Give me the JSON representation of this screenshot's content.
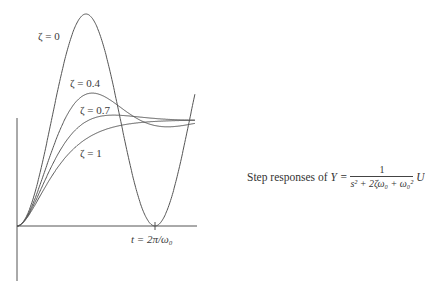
{
  "chart_data": {
    "type": "line",
    "title": "",
    "xlabel": "t",
    "ylabel": "",
    "x_tick_label": "t = 2π/ω₀",
    "x_range_omega0_t": [
      0,
      8.1
    ],
    "y_range": [
      0,
      2
    ],
    "grid": false,
    "steady_state_value": 1,
    "series": [
      {
        "name": "ζ = 0",
        "zeta": 0,
        "peak_value": 2.0
      },
      {
        "name": "ζ = 0.4",
        "zeta": 0.4,
        "peak_value": 1.25
      },
      {
        "name": "ζ = 0.7",
        "zeta": 0.7,
        "peak_value": 1.05
      },
      {
        "name": "ζ = 1",
        "zeta": 1,
        "peak_value": 1.0
      }
    ],
    "caption": {
      "prefix": "Step responses of",
      "lhs": "Y =",
      "numerator": "1",
      "denominator": "s² + 2ζω₀ + ω₀²",
      "suffix": "U"
    }
  }
}
